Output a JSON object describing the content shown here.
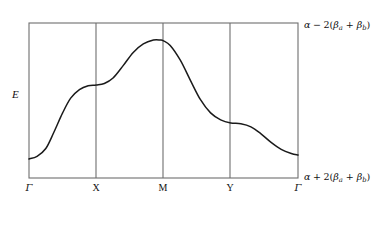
{
  "figure": {
    "type": "band-structure-plot",
    "background_color": "#ffffff",
    "line_color": "#1a1a1a",
    "frame_color": "#6b6b6b"
  },
  "axes": {
    "y_axis_label": "E",
    "x_tick_labels": [
      "Γ",
      "X",
      "M",
      "Y",
      "Γ"
    ],
    "energy_label_top": {
      "alpha": "α",
      "operator": "−",
      "coefficient": "2(",
      "beta_a": "β",
      "sub_a": "a",
      "plus": " + ",
      "beta_b": "β",
      "sub_b": "b",
      "close": ")"
    },
    "energy_label_bottom": {
      "alpha": "α",
      "operator": "+",
      "coefficient": "2(",
      "beta_a": "β",
      "sub_a": "a",
      "plus": " + ",
      "beta_b": "β",
      "sub_b": "b",
      "close": ")"
    }
  },
  "chart_data": {
    "type": "line",
    "title": "",
    "xlabel": "",
    "ylabel": "E",
    "grid": false,
    "legend": "none",
    "x_tick_labels": [
      "Γ",
      "X",
      "M",
      "Y",
      "Γ"
    ],
    "x_tick_positions": [
      0,
      1,
      2,
      3,
      4
    ],
    "xlim": [
      0,
      4
    ],
    "ylim": [
      0,
      1
    ],
    "y_axis_endpoints": {
      "top": "α − 2(βa + βb)",
      "bottom": "α + 2(βa + βb)"
    },
    "series": [
      {
        "name": "band",
        "x": [
          0.0,
          0.12,
          0.25,
          0.37,
          0.5,
          0.62,
          0.75,
          0.88,
          1.0,
          1.12,
          1.25,
          1.4,
          1.55,
          1.7,
          1.85,
          1.95,
          2.0,
          2.1,
          2.25,
          2.4,
          2.55,
          2.7,
          2.85,
          3.0,
          3.15,
          3.3,
          3.45,
          3.6,
          3.75,
          3.9,
          4.0
        ],
        "y": [
          0.123,
          0.14,
          0.19,
          0.295,
          0.42,
          0.515,
          0.57,
          0.595,
          0.6,
          0.61,
          0.645,
          0.725,
          0.81,
          0.865,
          0.89,
          0.89,
          0.885,
          0.855,
          0.76,
          0.63,
          0.505,
          0.42,
          0.375,
          0.355,
          0.35,
          0.33,
          0.285,
          0.23,
          0.185,
          0.158,
          0.148
        ]
      }
    ],
    "annotations": [
      {
        "label": "plateau at X",
        "x": 1.0,
        "y": 0.6
      },
      {
        "label": "maximum near M",
        "x": 1.95,
        "y": 0.89
      },
      {
        "label": "plateau at Y",
        "x": 3.0,
        "y": 0.355
      }
    ]
  },
  "geometry": {
    "frame": {
      "left": 29,
      "right": 298,
      "top": 23,
      "bottom": 178
    },
    "gridlines_x": [
      96,
      163,
      230
    ],
    "tick_label_x": [
      29,
      96,
      163,
      230,
      298
    ]
  }
}
